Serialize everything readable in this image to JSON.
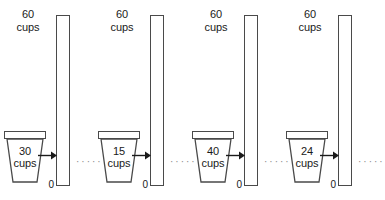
{
  "figure": {
    "type": "repeated-measure-diagram",
    "unit_word": "cups",
    "separator_dots": "·····",
    "axis_zero_label": "0",
    "axis_top_value": "60",
    "axis_top_unit": "cups",
    "outline_color": "#4a4a4a",
    "text_color": "#1a1a1a",
    "fill_color": "#ffffff",
    "dots_color": "#8a8a8a"
  },
  "units": [
    {
      "cup_value": "30",
      "cup_unit": "cups",
      "bar_top_value": "60",
      "bar_top_unit": "cups",
      "bar_zero": "0",
      "dots": "·····"
    },
    {
      "cup_value": "15",
      "cup_unit": "cups",
      "bar_top_value": "60",
      "bar_top_unit": "cups",
      "bar_zero": "0",
      "dots": "·····"
    },
    {
      "cup_value": "40",
      "cup_unit": "cups",
      "bar_top_value": "60",
      "bar_top_unit": "cups",
      "bar_zero": "0",
      "dots": "·····"
    },
    {
      "cup_value": "24",
      "cup_unit": "cups",
      "bar_top_value": "60",
      "bar_top_unit": "cups",
      "bar_zero": "0",
      "dots": "·····"
    }
  ]
}
